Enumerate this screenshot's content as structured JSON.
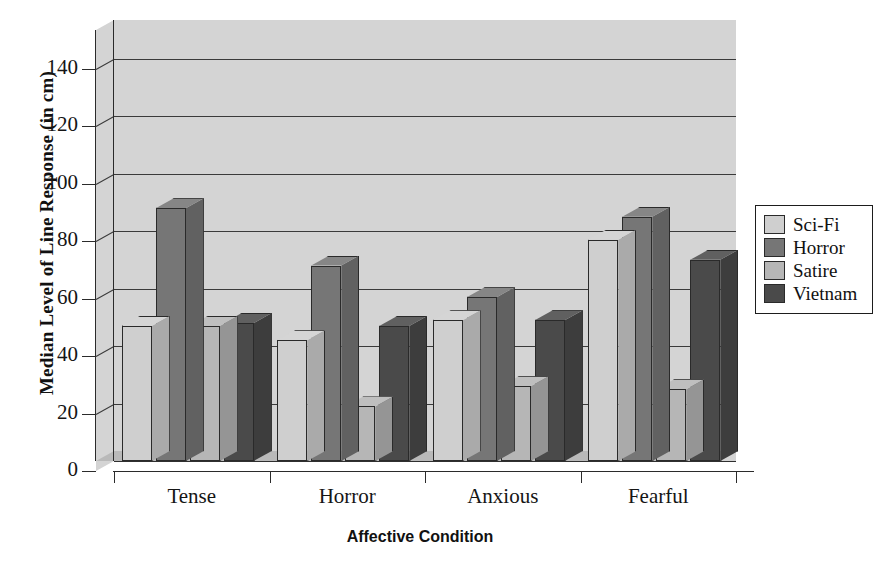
{
  "chart_data": {
    "type": "bar",
    "title": "",
    "xlabel": "Affective Condition",
    "ylabel": "Median Level of Line Response (in cm)",
    "categories": [
      "Tense",
      "Horror",
      "Anxious",
      "Fearful"
    ],
    "series": [
      {
        "name": "Sci-Fi",
        "color": "#cfcfcf",
        "values": [
          47,
          42,
          49,
          77
        ]
      },
      {
        "name": "Horror",
        "color": "#767676",
        "values": [
          88,
          68,
          57,
          85
        ]
      },
      {
        "name": "Satire",
        "color": "#b6b6b6",
        "values": [
          47,
          19,
          26,
          25
        ]
      },
      {
        "name": "Vietnam",
        "color": "#4a4a4a",
        "values": [
          48,
          47,
          49,
          70
        ]
      }
    ],
    "ylim": [
      0,
      150
    ],
    "yticks": [
      0,
      20,
      40,
      60,
      80,
      100,
      120,
      140
    ],
    "ytick_labels": [
      "0",
      "20",
      "40",
      "60",
      "80",
      "100",
      "120",
      "140"
    ],
    "grid": true,
    "grid_axis": "y",
    "legend_position": "right",
    "style_3d": true,
    "background": "#d3d3d3",
    "floor_color": "#b9b9b9"
  },
  "legend": {
    "entries": [
      {
        "label": "Sci-Fi"
      },
      {
        "label": "Horror"
      },
      {
        "label": "Satire"
      },
      {
        "label": "Vietnam"
      }
    ]
  },
  "axes": {
    "y_title": "Median Level of Line Response (in cm)",
    "x_title": "Affective Condition"
  }
}
